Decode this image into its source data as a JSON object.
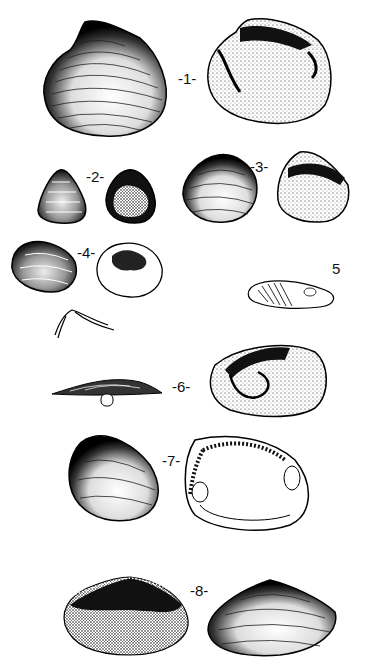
{
  "plate": {
    "type": "bivalve shell illustration plate",
    "background": "#ffffff",
    "ink": "#111111",
    "figures": [
      {
        "id": 1,
        "label": "-1-",
        "views": [
          "exterior left valve",
          "interior right valve"
        ]
      },
      {
        "id": 2,
        "label": "-2-",
        "views": [
          "exterior",
          "interior"
        ]
      },
      {
        "id": 3,
        "label": "-3-",
        "views": [
          "exterior",
          "interior"
        ]
      },
      {
        "id": 4,
        "label": "-4-",
        "views": [
          "exterior",
          "interior",
          "hinge detail"
        ]
      },
      {
        "id": 5,
        "label": "5",
        "views": [
          "interior"
        ]
      },
      {
        "id": 6,
        "label": "-6-",
        "views": [
          "dorsal view",
          "interior"
        ]
      },
      {
        "id": 7,
        "label": "-7-",
        "views": [
          "exterior",
          "interior"
        ]
      },
      {
        "id": 8,
        "label": "-8-",
        "views": [
          "interior",
          "exterior"
        ]
      }
    ]
  }
}
